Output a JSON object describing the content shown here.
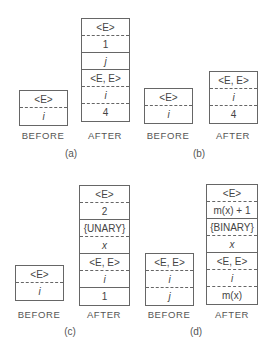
{
  "panels": [
    {
      "caption": "(a)",
      "before": {
        "label": "BEFORE",
        "cells": [
          {
            "text": "<E>",
            "italic": false,
            "sep": "dashed"
          },
          {
            "text": "i",
            "italic": true,
            "sep": "none"
          }
        ]
      },
      "after": {
        "label": "AFTER",
        "cells": [
          {
            "text": "<E>",
            "italic": false,
            "sep": "dashed"
          },
          {
            "text": "1",
            "italic": false,
            "sep": "solid"
          },
          {
            "text": "j",
            "italic": true,
            "sep": "solid"
          },
          {
            "text": "<E, E>",
            "italic": false,
            "sep": "dashed"
          },
          {
            "text": "i",
            "italic": true,
            "sep": "dashed"
          },
          {
            "text": "4",
            "italic": false,
            "sep": "none"
          }
        ]
      }
    },
    {
      "caption": "(b)",
      "before": {
        "label": "BEFORE",
        "cells": [
          {
            "text": "<E>",
            "italic": false,
            "sep": "dashed"
          },
          {
            "text": "i",
            "italic": true,
            "sep": "none"
          }
        ]
      },
      "after": {
        "label": "AFTER",
        "cells": [
          {
            "text": "<E, E>",
            "italic": false,
            "sep": "dashed"
          },
          {
            "text": "i",
            "italic": true,
            "sep": "dashed"
          },
          {
            "text": "4",
            "italic": false,
            "sep": "none"
          }
        ]
      }
    },
    {
      "caption": "(c)",
      "before": {
        "label": "BEFORE",
        "cells": [
          {
            "text": "<E>",
            "italic": false,
            "sep": "dashed"
          },
          {
            "text": "i",
            "italic": true,
            "sep": "none"
          }
        ]
      },
      "after": {
        "label": "AFTER",
        "cells": [
          {
            "text": "<E>",
            "italic": false,
            "sep": "dashed"
          },
          {
            "text": "2",
            "italic": false,
            "sep": "solid"
          },
          {
            "text": "{UNARY}",
            "italic": false,
            "sep": "dashed"
          },
          {
            "text": "x",
            "italic": true,
            "sep": "solid"
          },
          {
            "text": "<E, E>",
            "italic": false,
            "sep": "dashed"
          },
          {
            "text": "i",
            "italic": true,
            "sep": "solid"
          },
          {
            "text": "1",
            "italic": false,
            "sep": "none"
          }
        ]
      }
    },
    {
      "caption": "(d)",
      "before": {
        "label": "BEFORE",
        "cells": [
          {
            "text": "<E, E>",
            "italic": false,
            "sep": "dashed"
          },
          {
            "text": "i",
            "italic": true,
            "sep": "dashed"
          },
          {
            "text": "j",
            "italic": true,
            "sep": "none"
          }
        ]
      },
      "after": {
        "label": "AFTER",
        "cells": [
          {
            "text": "<E>",
            "italic": false,
            "sep": "dashed"
          },
          {
            "text": "m(x) + 1",
            "italic": false,
            "sep": "solid"
          },
          {
            "text": "{BINARY}",
            "italic": false,
            "sep": "dashed"
          },
          {
            "text": "x",
            "italic": true,
            "sep": "solid"
          },
          {
            "text": "<E, E>",
            "italic": false,
            "sep": "dashed"
          },
          {
            "text": "i",
            "italic": true,
            "sep": "dashed"
          },
          {
            "text": "m(x)",
            "italic": false,
            "sep": "none"
          }
        ]
      }
    }
  ]
}
